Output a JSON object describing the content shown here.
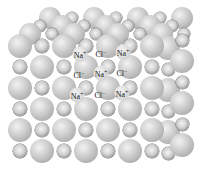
{
  "figure": {
    "background": "#ffffff",
    "colors": {
      "chloride_sphere": "#c4c4c4",
      "sodium_sphere": "#9a9a9a",
      "label_text": "#1a1a1a"
    },
    "ion_labels": [
      {
        "symbol": "Na",
        "charge": "+",
        "row": 1,
        "col": 1,
        "x": 80,
        "y": 54
      },
      {
        "symbol": "Cl",
        "charge": "−",
        "row": 1,
        "col": 2,
        "x": 101,
        "y": 53
      },
      {
        "symbol": "Na",
        "charge": "+",
        "row": 1,
        "col": 3,
        "x": 123,
        "y": 52
      },
      {
        "symbol": "Cl",
        "charge": "−",
        "row": 2,
        "col": 1,
        "x": 79,
        "y": 74
      },
      {
        "symbol": "Na",
        "charge": "+",
        "row": 2,
        "col": 2,
        "x": 101,
        "y": 73
      },
      {
        "symbol": "Cl",
        "charge": "−",
        "row": 2,
        "col": 3,
        "x": 122,
        "y": 72
      },
      {
        "symbol": "Na",
        "charge": "+",
        "row": 3,
        "col": 1,
        "x": 77,
        "y": 95
      },
      {
        "symbol": "Cl",
        "charge": "−",
        "row": 3,
        "col": 2,
        "x": 100,
        "y": 94
      },
      {
        "symbol": "Na",
        "charge": "+",
        "row": 3,
        "col": 3,
        "x": 122,
        "y": 93
      }
    ]
  }
}
